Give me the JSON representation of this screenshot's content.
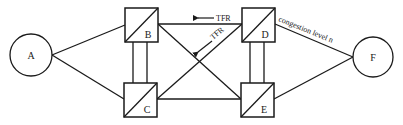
{
  "diagram": {
    "type": "network-topology",
    "colors": {
      "line": "#1a1a1a",
      "background": "#ffffff"
    },
    "nodes": {
      "A": {
        "label": "A",
        "shape": "circle"
      },
      "B": {
        "label": "B",
        "shape": "split-square"
      },
      "C": {
        "label": "C",
        "shape": "split-square"
      },
      "D": {
        "label": "D",
        "shape": "split-square"
      },
      "E": {
        "label": "E",
        "shape": "split-square"
      },
      "F": {
        "label": "F",
        "shape": "circle"
      }
    },
    "edges": [
      {
        "from": "A",
        "to": "B"
      },
      {
        "from": "A",
        "to": "C"
      },
      {
        "from": "B",
        "to": "C",
        "style": "double"
      },
      {
        "from": "B",
        "to": "D"
      },
      {
        "from": "B",
        "to": "E"
      },
      {
        "from": "C",
        "to": "D"
      },
      {
        "from": "C",
        "to": "E"
      },
      {
        "from": "D",
        "to": "E",
        "style": "double"
      },
      {
        "from": "D",
        "to": "F",
        "label": "congestion level n"
      },
      {
        "from": "E",
        "to": "F"
      }
    ],
    "annotations": {
      "tfr_top": "TFR",
      "tfr_diagonal": "TFR",
      "congestion": "congestion level n"
    }
  }
}
